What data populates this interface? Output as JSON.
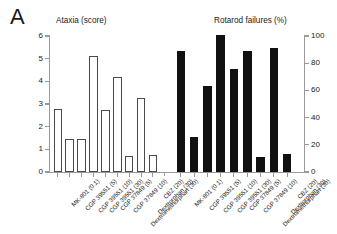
{
  "panel": {
    "letter": "A"
  },
  "titles": {
    "left": "Ataxia  (score)",
    "right": "Rotarod failures  (%)"
  },
  "axes": {
    "left": {
      "label": "Ataxia (score)",
      "min": 0,
      "max": 6,
      "ticks": [
        0,
        1,
        2,
        3,
        4,
        5,
        6
      ],
      "tick_labels": [
        "0",
        "1",
        "2",
        "3",
        "4",
        "5",
        "6"
      ]
    },
    "right": {
      "label": "Rotarod failures (%)",
      "min": 0,
      "max": 100,
      "ticks": [
        0,
        20,
        40,
        60,
        80,
        100
      ],
      "tick_labels": [
        "0",
        "20",
        "40",
        "60",
        "80",
        "100"
      ]
    }
  },
  "categories": [
    "MK-801 (0.1)",
    "CGP 39551 (5)",
    "CGP 39551 (10)",
    "CGP 39551 (30)",
    "CGP 37849 (5)",
    "CGP 37849 (10)",
    "Dextromethorphan (30)",
    "Dextrorphan (30)",
    "CBZ (20)"
  ],
  "colors": {
    "open_bar_fill": "#ffffff",
    "open_bar_edge": "#4a4a4a",
    "filled_bar": "#111111",
    "axis": "#9a9a9a",
    "text": "#1a1a1a"
  },
  "chart_data": {
    "type": "bar",
    "title": "",
    "xlabel": "",
    "grid": false,
    "legend_position": "none",
    "panels": [
      {
        "name": "ataxia",
        "title": "Ataxia  (score)",
        "ylabel": "Ataxia (score)",
        "ylim": [
          0,
          6
        ],
        "yticks": [
          0,
          1,
          2,
          3,
          4,
          5,
          6
        ],
        "bar_style": "open",
        "categories": [
          "MK-801 (0.1)",
          "CGP 39551 (5)",
          "CGP 39551 (10)",
          "CGP 39551 (30)",
          "CGP 37849 (5)",
          "CGP 37849 (10)",
          "Dextromethorphan (30)",
          "Dextrorphan (30)",
          "CBZ (20)"
        ],
        "values": [
          2.8,
          1.45,
          1.45,
          5.1,
          2.75,
          4.2,
          0.72,
          3.25,
          0.73
        ]
      },
      {
        "name": "rotarod_failures",
        "title": "Rotarod failures  (%)",
        "ylabel": "Rotarod failures (%)",
        "ylim": [
          0,
          100
        ],
        "yticks": [
          0,
          20,
          40,
          60,
          80,
          100
        ],
        "bar_style": "filled",
        "categories": [
          "MK-801 (0.1)",
          "CGP 39551 (5)",
          "CGP 39551 (10)",
          "CGP 39551 (30)",
          "CGP 37849 (5)",
          "CGP 37849 (10)",
          "Dextromethorphan (30)",
          "Dextrorphan (30)",
          "CBZ (20)"
        ],
        "values": [
          89,
          26,
          63,
          101,
          76,
          89,
          11,
          91,
          13
        ]
      }
    ]
  }
}
